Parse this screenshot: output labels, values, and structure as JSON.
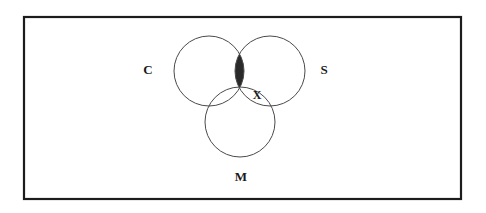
{
  "figure": {
    "type": "venn-diagram",
    "set_count": 3,
    "frame": {
      "name": "universal-set-rectangle",
      "x": 24,
      "y": 17,
      "width": 437,
      "height": 182,
      "stroke_color": "#1c1c1c",
      "stroke_width": 2.2
    },
    "circles": [
      {
        "id": "C",
        "label": "C",
        "cx": 209,
        "cy": 71,
        "r": 35,
        "label_x": 148,
        "label_y": 71,
        "stroke_color": "#4a4a4a"
      },
      {
        "id": "S",
        "label": "S",
        "cx": 270,
        "cy": 71,
        "r": 35,
        "label_x": 324,
        "label_y": 71,
        "stroke_color": "#4a4a4a"
      },
      {
        "id": "M",
        "label": "M",
        "cx": 240,
        "cy": 122,
        "r": 35,
        "label_x": 241,
        "label_y": 178,
        "stroke_color": "#4a4a4a"
      }
    ],
    "shaded_region": {
      "name": "c-intersect-s-minus-m",
      "description": "C and S overlap excluding M",
      "fill_color": "#2a2a2a"
    },
    "point_labels": [
      {
        "id": "X",
        "label": "X",
        "x": 257,
        "y": 96
      }
    ]
  }
}
